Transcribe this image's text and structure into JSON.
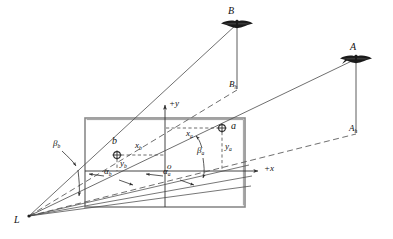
{
  "figure": {
    "type": "technical-diagram",
    "background_color": "#ffffff",
    "line_color": "#3a3a3a",
    "plane_edge_color": "#7d7d7d",
    "text_color": "#111111"
  },
  "labels": {
    "exposure_station": "L",
    "object_point_b_upper": "B",
    "object_point_b_ground": {
      "base": "B",
      "sub": "h"
    },
    "object_point_a_upper": "A",
    "object_point_a_ground": {
      "base": "A",
      "sub": "h"
    },
    "image_point_a": "a",
    "image_point_b": "b",
    "origin": "o",
    "axis_x": "+x",
    "axis_y": "+y",
    "coord_xa": {
      "base": "x",
      "sub": "a"
    },
    "coord_ya": {
      "base": "y",
      "sub": "a"
    },
    "coord_xb": {
      "base": "x",
      "sub": "b"
    },
    "coord_yb": {
      "base": "y",
      "sub": "b"
    },
    "angle_alpha_a": {
      "base": "α",
      "sub": "a"
    },
    "angle_alpha_b": {
      "base": "α",
      "sub": "b"
    },
    "angle_beta_a": {
      "base": "β",
      "sub": "a"
    },
    "angle_beta_b": {
      "base": "β",
      "sub": "b"
    }
  },
  "geometry": {
    "image_plane": {
      "x": 85,
      "y": 118,
      "width": 160,
      "height": 89
    },
    "origin_point": {
      "x": 165,
      "y": 171
    },
    "point_a": {
      "x": 222,
      "y": 128
    },
    "point_b": {
      "x": 117,
      "y": 155
    },
    "station_L": {
      "x": 29,
      "y": 216
    },
    "point_A": {
      "x": 356,
      "y": 56
    },
    "point_Ah": {
      "x": 356,
      "y": 131
    },
    "point_B": {
      "x": 237,
      "y": 21
    },
    "point_Bh": {
      "x": 237,
      "y": 87
    },
    "axis_x_end": {
      "x": 262,
      "y": 171
    },
    "axis_y_top": {
      "x": 165,
      "y": 106
    }
  }
}
